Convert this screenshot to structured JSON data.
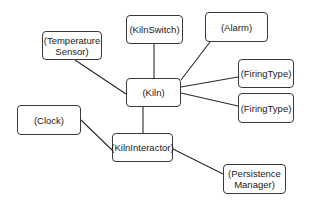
{
  "diagram": {
    "type": "object-association-diagram",
    "nodes": [
      {
        "id": "temperature-sensor",
        "label": "(Temperature Sensor)",
        "x": 42,
        "y": 31,
        "w": 60,
        "h": 29
      },
      {
        "id": "kiln-switch",
        "label": "(KilnSwitch)",
        "x": 126,
        "y": 15,
        "w": 57,
        "h": 29
      },
      {
        "id": "alarm",
        "label": "(Alarm)",
        "x": 205,
        "y": 12,
        "w": 63,
        "h": 30
      },
      {
        "id": "kiln",
        "label": "(Kiln)",
        "x": 126,
        "y": 78,
        "w": 55,
        "h": 29
      },
      {
        "id": "firing-type-1",
        "label": "(FiringType)",
        "x": 238,
        "y": 59,
        "w": 56,
        "h": 29
      },
      {
        "id": "firing-type-2",
        "label": "(FiringType)",
        "x": 238,
        "y": 93,
        "w": 56,
        "h": 30
      },
      {
        "id": "clock",
        "label": "(Clock)",
        "x": 17,
        "y": 105,
        "w": 64,
        "h": 30
      },
      {
        "id": "kiln-interactor",
        "label": "(KilnInteractor)",
        "x": 112,
        "y": 133,
        "w": 61,
        "h": 29
      },
      {
        "id": "persistence-manager",
        "label": "(Persistence Manager)",
        "x": 223,
        "y": 164,
        "w": 63,
        "h": 30
      }
    ],
    "edges": [
      {
        "from": "temperature-sensor",
        "to": "kiln",
        "x1": 75,
        "y1": 60,
        "x2": 126,
        "y2": 94
      },
      {
        "from": "kiln-switch",
        "to": "kiln",
        "x1": 154,
        "y1": 44,
        "x2": 154,
        "y2": 78
      },
      {
        "from": "alarm",
        "to": "kiln",
        "x1": 210,
        "y1": 42,
        "x2": 181,
        "y2": 80
      },
      {
        "from": "kiln",
        "to": "firing-type-1",
        "x1": 181,
        "y1": 87,
        "x2": 238,
        "y2": 77
      },
      {
        "from": "kiln",
        "to": "firing-type-2",
        "x1": 181,
        "y1": 93,
        "x2": 238,
        "y2": 106
      },
      {
        "from": "kiln",
        "to": "kiln-interactor",
        "x1": 143,
        "y1": 107,
        "x2": 143,
        "y2": 133
      },
      {
        "from": "clock",
        "to": "kiln-interactor",
        "x1": 81,
        "y1": 120,
        "x2": 112,
        "y2": 150
      },
      {
        "from": "kiln-interactor",
        "to": "persistence-manager",
        "x1": 173,
        "y1": 149,
        "x2": 223,
        "y2": 174
      }
    ]
  }
}
